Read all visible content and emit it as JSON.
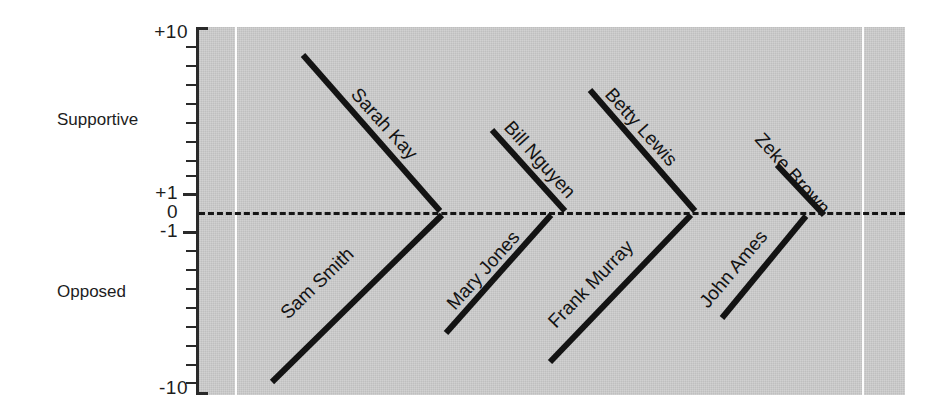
{
  "chart_data": {
    "type": "line",
    "title": "",
    "xlabel": "",
    "ylabel": "",
    "ylim": [
      -10,
      10
    ],
    "grid": true,
    "legend": "none",
    "axis_note": "symmetric log-like scale; +1/0/-1 compressed near center",
    "y_tick_labels": [
      "+10",
      "+1",
      "0",
      "-1",
      "-10"
    ],
    "y_category_labels": [
      "Supportive",
      "Opposed"
    ],
    "zero_reference_line": 0,
    "series": [
      {
        "name": "Sarah Kay",
        "side": "supportive",
        "value": 9.0,
        "pair": 1
      },
      {
        "name": "Sam Smith",
        "side": "opposed",
        "value": -9.7,
        "pair": 1
      },
      {
        "name": "Bill Nguyen",
        "side": "supportive",
        "value": 4.6,
        "pair": 2
      },
      {
        "name": "Mary Jones",
        "side": "opposed",
        "value": -7.1,
        "pair": 2
      },
      {
        "name": "Betty Lewis",
        "side": "supportive",
        "value": 7.1,
        "pair": 3
      },
      {
        "name": "Frank Murray",
        "side": "opposed",
        "value": -8.7,
        "pair": 3
      },
      {
        "name": "Zeke Brown",
        "side": "supportive",
        "value": 2.6,
        "pair": 4
      },
      {
        "name": "John Ames",
        "side": "opposed",
        "value": -5.5,
        "pair": 4
      }
    ]
  },
  "axis": {
    "top_label": "+10",
    "plus_one": "+1",
    "zero": "0",
    "minus_one": "-1",
    "bottom_label": "-10",
    "supportive": "Supportive",
    "opposed": "Opposed"
  },
  "colors": {
    "plot_background": "#c9c9c9",
    "stroke": "#131313",
    "gridline": "#fdfdfd",
    "page_background": "#ffffff"
  },
  "geometry": {
    "zero_y": 212,
    "top_y": 27,
    "bottom_y": 395,
    "plot_left": 199,
    "plot_right": 905,
    "gridlines_x": [
      235,
      862
    ],
    "lines": [
      {
        "name": "Sarah Kay",
        "x1": 303,
        "y1": 55,
        "x2": 440,
        "y2": 211,
        "label_x": 350,
        "label_y": 95,
        "rot": 48
      },
      {
        "name": "Sam Smith",
        "x1": 272,
        "y1": 382,
        "x2": 442,
        "y2": 215,
        "label_x": 288,
        "label_y": 320,
        "rot": -44
      },
      {
        "name": "Bill Nguyen",
        "x1": 492,
        "y1": 130,
        "x2": 565,
        "y2": 211,
        "label_x": 503,
        "label_y": 128,
        "rot": 48
      },
      {
        "name": "Mary Jones",
        "x1": 446,
        "y1": 333,
        "x2": 551,
        "y2": 215,
        "label_x": 455,
        "label_y": 311,
        "rot": -48
      },
      {
        "name": "Betty Lewis",
        "x1": 590,
        "y1": 90,
        "x2": 695,
        "y2": 211,
        "label_x": 604,
        "label_y": 95,
        "rot": 48
      },
      {
        "name": "Frank Murray",
        "x1": 550,
        "y1": 362,
        "x2": 691,
        "y2": 215,
        "label_x": 556,
        "label_y": 329,
        "rot": -46
      },
      {
        "name": "Zeke Brown",
        "x1": 777,
        "y1": 165,
        "x2": 824,
        "y2": 215,
        "label_x": 754,
        "label_y": 140,
        "rot": 48
      },
      {
        "name": "John Ames",
        "x1": 722,
        "y1": 318,
        "x2": 806,
        "y2": 216,
        "label_x": 708,
        "label_y": 309,
        "rot": -50
      }
    ],
    "ticks_y": [
      46,
      65,
      84,
      103,
      122,
      141,
      160,
      175,
      193,
      231,
      250,
      269,
      288,
      307,
      326,
      345,
      364,
      382
    ],
    "major_ticks_y": [
      193,
      231
    ]
  }
}
